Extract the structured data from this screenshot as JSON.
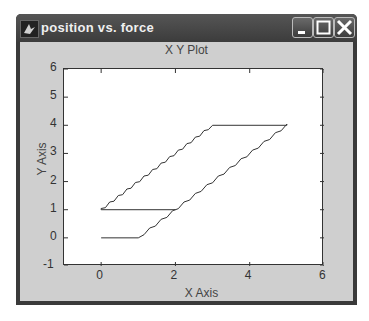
{
  "window": {
    "title": "position vs. force",
    "icon": "matlab-figure-icon",
    "buttons": [
      "minimize",
      "maximize",
      "close"
    ]
  },
  "plot": {
    "title": "X Y Plot",
    "xlabel": "X Axis",
    "ylabel": "Y Axis",
    "xticks": [
      "0",
      "2",
      "4",
      "6"
    ],
    "yticks": [
      "-1",
      "0",
      "1",
      "2",
      "3",
      "4",
      "5",
      "6"
    ]
  },
  "chart_data": {
    "type": "line",
    "title": "X Y Plot",
    "xlabel": "X Axis",
    "ylabel": "Y Axis",
    "xlim": [
      -1,
      6
    ],
    "ylim": [
      -1,
      6
    ],
    "grid": false,
    "series": [
      {
        "name": "hysteresis loop",
        "x": [
          0,
          1,
          5,
          3,
          0,
          2
        ],
        "y": [
          0,
          0,
          4,
          4,
          1,
          1
        ]
      }
    ]
  }
}
